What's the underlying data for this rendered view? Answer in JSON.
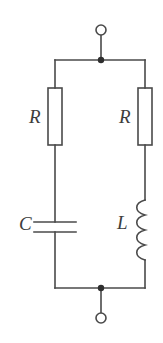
{
  "figure": {
    "background_color": "#ffffff",
    "line_color": "#4a4a4a",
    "label_color": "#3d3d3d",
    "width": 163,
    "height": 343
  },
  "labels": {
    "resistor_left": "R",
    "resistor_right": "R",
    "capacitor": "C",
    "inductor": "L"
  },
  "geometry": {
    "top_rail_y": 60,
    "bottom_rail_y": 288,
    "left_branch_x": 55,
    "right_branch_x": 145,
    "center_x": 101,
    "top_terminal_cy": 30,
    "bottom_terminal_cy": 318,
    "terminal_radius": 5,
    "junction_radius": 3,
    "resistor_box": {
      "top": 88,
      "bottom": 145,
      "half_width": 7
    },
    "capacitor_plates": {
      "top_y": 222,
      "bottom_y": 232,
      "half_width": 21
    },
    "inductor_coil": {
      "top": 200,
      "bottom": 260,
      "bumps": 4,
      "bulge": 9
    }
  },
  "components": [
    {
      "name": "terminal-top",
      "type": "open-terminal"
    },
    {
      "name": "resistor-left",
      "type": "resistor",
      "label": "R",
      "branch": "left"
    },
    {
      "name": "capacitor-left",
      "type": "capacitor",
      "label": "C",
      "branch": "left"
    },
    {
      "name": "resistor-right",
      "type": "resistor",
      "label": "R",
      "branch": "right"
    },
    {
      "name": "inductor-right",
      "type": "inductor",
      "label": "L",
      "branch": "right"
    },
    {
      "name": "terminal-bottom",
      "type": "open-terminal"
    }
  ]
}
